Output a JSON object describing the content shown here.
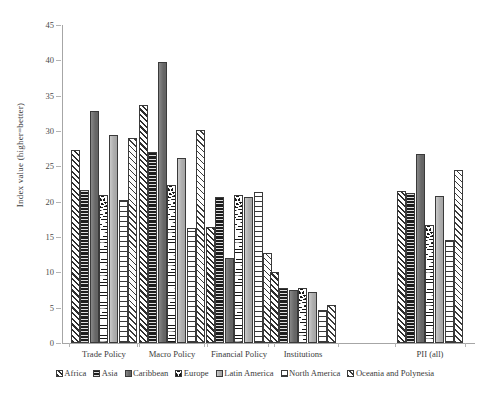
{
  "chart_data": {
    "type": "bar",
    "title": "",
    "xlabel": "",
    "ylabel": "Index value (higher=better)",
    "ylim": [
      0,
      45
    ],
    "yticks": [
      0,
      5,
      10,
      15,
      20,
      25,
      30,
      35,
      40,
      45
    ],
    "grid": false,
    "legend_position": "bottom",
    "categories": [
      "Trade Policy",
      "Macro Policy",
      "Financial Policy",
      "Institutions",
      "PII (all)"
    ],
    "series": [
      {
        "name": "Africa",
        "pattern": "diagonal-hatch-black",
        "values": [
          27.3,
          33.7,
          16.4,
          10.0,
          21.5
        ]
      },
      {
        "name": "Asia",
        "pattern": "solid-black-dotted",
        "values": [
          21.6,
          27.0,
          20.6,
          7.8,
          21.2
        ]
      },
      {
        "name": "Caribbean",
        "pattern": "solid-dark-gray",
        "values": [
          32.9,
          39.8,
          12.0,
          7.5,
          26.7
        ]
      },
      {
        "name": "Europe",
        "pattern": "black-dot-grid",
        "values": [
          20.9,
          22.4,
          21.0,
          7.8,
          16.7
        ]
      },
      {
        "name": "Latin America",
        "pattern": "solid-light-gray",
        "values": [
          29.4,
          26.2,
          20.7,
          7.2,
          20.8
        ]
      },
      {
        "name": "North America",
        "pattern": "white-grid-lines",
        "values": [
          20.2,
          16.3,
          21.4,
          4.7,
          14.6
        ]
      },
      {
        "name": "Oceania and Polynesia",
        "pattern": "white-diagonal-hatch",
        "values": [
          29.0,
          30.1,
          12.7,
          5.4,
          24.5
        ]
      }
    ]
  },
  "colors": {
    "axis": "#a6a6a6",
    "text": "#3b3b3b",
    "background": "#ffffff"
  }
}
